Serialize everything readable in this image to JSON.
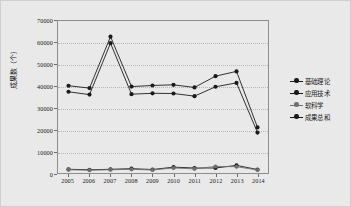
{
  "chart_data": {
    "type": "line",
    "title": "",
    "xlabel": "",
    "ylabel": "成果数（个）",
    "x": [
      2005,
      2006,
      2007,
      2008,
      2009,
      2010,
      2011,
      2012,
      2013,
      2014
    ],
    "categories": [
      "2005",
      "2006",
      "2007",
      "2008",
      "2009",
      "2010",
      "2011",
      "2012",
      "2013",
      "2014"
    ],
    "ylim": [
      0,
      70000
    ],
    "yticks": [
      0,
      10000,
      20000,
      30000,
      40000,
      50000,
      60000,
      70000
    ],
    "ytick_labels": [
      "0",
      "10000",
      "20000",
      "30000",
      "40000",
      "50000",
      "60000",
      "70000"
    ],
    "grid": true,
    "legend_position": "right",
    "marker": "circle",
    "series": [
      {
        "name": "基础理论",
        "color": "#1a1a1a",
        "values": [
          37400,
          36100,
          59800,
          36300,
          36700,
          36600,
          35400,
          39700,
          41500,
          18600
        ]
      },
      {
        "name": "应用技术",
        "color": "#1a1a1a",
        "values": [
          1700,
          1500,
          1700,
          2000,
          1600,
          2700,
          2300,
          2300,
          3500,
          1600
        ]
      },
      {
        "name": "软科学",
        "color": "#6e6e6e",
        "values": [
          1500,
          1300,
          1500,
          1700,
          1400,
          2300,
          1900,
          3000,
          2900,
          1400
        ]
      },
      {
        "name": "成果总和",
        "color": "#1a1a1a",
        "values": [
          40200,
          39100,
          62800,
          39800,
          40300,
          40600,
          39400,
          44600,
          46800,
          21000
        ]
      }
    ]
  }
}
